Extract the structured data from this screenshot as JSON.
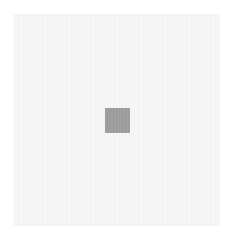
{
  "canvas": {
    "width": 232,
    "height": 238,
    "background_color": "#ffffff"
  },
  "panel": {
    "color": "#f5f5f5",
    "pattern": "faint-vertical-stripes"
  },
  "square": {
    "color": "#9e9e9e",
    "size": 25
  }
}
